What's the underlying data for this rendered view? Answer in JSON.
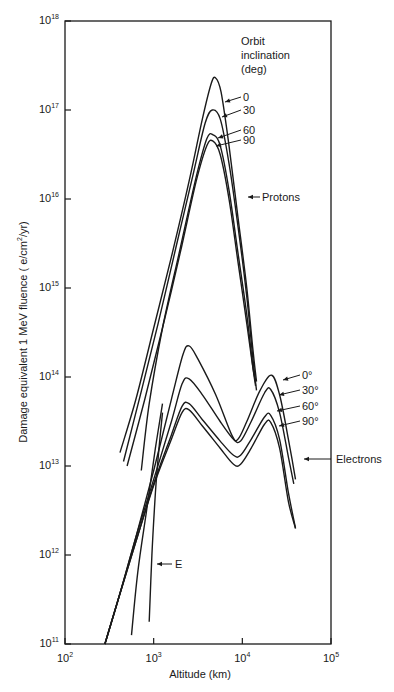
{
  "chart_data": {
    "type": "line",
    "title": "",
    "xlabel": "Altitude (km)",
    "ylabel": "Damage equivalent 1 MeV fluence ( e/cm²/yr)",
    "ylabel_parts": {
      "pre": "Damage equivalent 1 MeV fluence ( e/cm",
      "sup": "2",
      "post": "/yr)"
    },
    "xscale": "log",
    "yscale": "log",
    "xlim": [
      100,
      100000
    ],
    "ylim": [
      100000000000.0,
      1e+18
    ],
    "grid": false,
    "x_ticks": [
      {
        "base": "10",
        "exp": "2"
      },
      {
        "base": "10",
        "exp": "3"
      },
      {
        "base": "10",
        "exp": "4"
      },
      {
        "base": "10",
        "exp": "5"
      }
    ],
    "y_ticks": [
      {
        "base": "10",
        "exp": "18"
      },
      {
        "base": "10",
        "exp": "17"
      },
      {
        "base": "10",
        "exp": "16"
      },
      {
        "base": "10",
        "exp": "15"
      },
      {
        "base": "10",
        "exp": "14"
      },
      {
        "base": "10",
        "exp": "13"
      },
      {
        "base": "10",
        "exp": "12"
      },
      {
        "base": "10",
        "exp": "11"
      }
    ],
    "legend": {
      "title_lines": [
        "Orbit",
        "inclination",
        "(deg)"
      ],
      "position": "top-right inside"
    },
    "series": [
      {
        "name": "Protons 0°",
        "group": "Protons",
        "inclination": 0,
        "points_log": [
          [
            2.62,
            13.15
          ],
          [
            2.8,
            13.75
          ],
          [
            3.0,
            14.55
          ],
          [
            3.2,
            15.35
          ],
          [
            3.4,
            16.2
          ],
          [
            3.55,
            16.9
          ],
          [
            3.65,
            17.3
          ],
          [
            3.7,
            17.36
          ],
          [
            3.76,
            17.2
          ],
          [
            3.85,
            16.6
          ],
          [
            3.95,
            15.8
          ],
          [
            4.05,
            15.0
          ],
          [
            4.12,
            14.3
          ],
          [
            4.16,
            13.95
          ]
        ]
      },
      {
        "name": "Protons 30°",
        "group": "Protons",
        "inclination": 30,
        "points_log": [
          [
            2.66,
            13.05
          ],
          [
            2.85,
            13.8
          ],
          [
            3.05,
            14.6
          ],
          [
            3.25,
            15.45
          ],
          [
            3.45,
            16.3
          ],
          [
            3.58,
            16.85
          ],
          [
            3.66,
            17.0
          ],
          [
            3.75,
            16.9
          ],
          [
            3.85,
            16.4
          ],
          [
            3.95,
            15.7
          ],
          [
            4.05,
            14.9
          ],
          [
            4.12,
            14.2
          ],
          [
            4.16,
            13.85
          ]
        ]
      },
      {
        "name": "Protons 60°",
        "group": "Protons",
        "inclination": 60,
        "points_log": [
          [
            2.86,
            12.95
          ],
          [
            2.95,
            13.7
          ],
          [
            3.1,
            14.55
          ],
          [
            3.3,
            15.45
          ],
          [
            3.48,
            16.25
          ],
          [
            3.6,
            16.68
          ],
          [
            3.67,
            16.72
          ],
          [
            3.75,
            16.6
          ],
          [
            3.85,
            16.1
          ],
          [
            3.95,
            15.4
          ],
          [
            4.05,
            14.7
          ],
          [
            4.12,
            14.1
          ],
          [
            4.15,
            13.9
          ]
        ]
      },
      {
        "name": "Protons 90°",
        "group": "Protons",
        "inclination": 90,
        "points_log": [
          [
            2.7,
            13.0
          ],
          [
            2.9,
            13.75
          ],
          [
            3.1,
            14.55
          ],
          [
            3.3,
            15.4
          ],
          [
            3.48,
            16.2
          ],
          [
            3.6,
            16.6
          ],
          [
            3.67,
            16.65
          ],
          [
            3.75,
            16.5
          ],
          [
            3.85,
            16.0
          ],
          [
            3.95,
            15.3
          ],
          [
            4.05,
            14.6
          ],
          [
            4.12,
            14.1
          ],
          [
            4.15,
            13.95
          ]
        ]
      },
      {
        "name": "Electrons 0°",
        "group": "Electrons",
        "inclination": 0,
        "points_log": [
          [
            2.45,
            11.0
          ],
          [
            2.6,
            11.5
          ],
          [
            2.8,
            12.2
          ],
          [
            3.0,
            12.95
          ],
          [
            3.2,
            13.75
          ],
          [
            3.33,
            14.25
          ],
          [
            3.4,
            14.35
          ],
          [
            3.5,
            14.2
          ],
          [
            3.7,
            13.8
          ],
          [
            3.88,
            13.35
          ],
          [
            3.95,
            13.3
          ],
          [
            4.05,
            13.5
          ],
          [
            4.2,
            13.85
          ],
          [
            4.33,
            14.02
          ],
          [
            4.42,
            13.8
          ],
          [
            4.52,
            13.3
          ],
          [
            4.6,
            12.85
          ]
        ]
      },
      {
        "name": "Electrons 30°",
        "group": "Electrons",
        "inclination": 30,
        "points_log": [
          [
            2.45,
            11.0
          ],
          [
            2.6,
            11.5
          ],
          [
            2.8,
            12.2
          ],
          [
            3.0,
            12.85
          ],
          [
            3.2,
            13.5
          ],
          [
            3.32,
            13.92
          ],
          [
            3.4,
            13.98
          ],
          [
            3.55,
            13.8
          ],
          [
            3.75,
            13.5
          ],
          [
            3.9,
            13.3
          ],
          [
            3.98,
            13.28
          ],
          [
            4.1,
            13.5
          ],
          [
            4.25,
            13.82
          ],
          [
            4.32,
            13.86
          ],
          [
            4.42,
            13.6
          ],
          [
            4.52,
            13.1
          ],
          [
            4.58,
            12.8
          ]
        ]
      },
      {
        "name": "Electrons 60°",
        "group": "Electrons",
        "inclination": 60,
        "points_log": [
          [
            2.45,
            11.0
          ],
          [
            2.6,
            11.5
          ],
          [
            2.8,
            12.15
          ],
          [
            3.0,
            12.8
          ],
          [
            3.2,
            13.35
          ],
          [
            3.32,
            13.67
          ],
          [
            3.4,
            13.7
          ],
          [
            3.55,
            13.52
          ],
          [
            3.75,
            13.28
          ],
          [
            3.9,
            13.12
          ],
          [
            3.98,
            13.12
          ],
          [
            4.1,
            13.3
          ],
          [
            4.25,
            13.55
          ],
          [
            4.32,
            13.57
          ],
          [
            4.42,
            13.3
          ],
          [
            4.52,
            12.7
          ],
          [
            4.6,
            12.3
          ]
        ]
      },
      {
        "name": "Electrons 90°",
        "group": "Electrons",
        "inclination": 90,
        "points_log": [
          [
            2.45,
            11.0
          ],
          [
            2.6,
            11.5
          ],
          [
            2.8,
            12.15
          ],
          [
            3.0,
            12.78
          ],
          [
            3.2,
            13.3
          ],
          [
            3.32,
            13.6
          ],
          [
            3.4,
            13.63
          ],
          [
            3.55,
            13.45
          ],
          [
            3.75,
            13.2
          ],
          [
            3.9,
            13.02
          ],
          [
            3.98,
            13.02
          ],
          [
            4.1,
            13.2
          ],
          [
            4.25,
            13.47
          ],
          [
            4.32,
            13.49
          ],
          [
            4.42,
            13.2
          ],
          [
            4.52,
            12.6
          ],
          [
            4.6,
            12.3
          ]
        ]
      },
      {
        "name": "E curve",
        "group": "E",
        "points_log": [
          [
            2.95,
            11.25
          ],
          [
            2.98,
            12.0
          ],
          [
            3.02,
            12.7
          ],
          [
            3.06,
            13.2
          ],
          [
            3.1,
            13.6
          ]
        ]
      },
      {
        "name": "Low-altitude branch",
        "group": "Electrons",
        "points_log": [
          [
            2.75,
            11.1
          ],
          [
            2.82,
            11.8
          ],
          [
            2.92,
            12.5
          ],
          [
            3.02,
            13.2
          ],
          [
            3.1,
            13.7
          ]
        ]
      }
    ],
    "annotations": {
      "protons_inclinations": [
        "0",
        "30",
        "60",
        "90"
      ],
      "electrons_inclinations": [
        "0°",
        "30°",
        "60°",
        "90°"
      ],
      "protons_label": "Protons",
      "electrons_label": "Electrons",
      "e_label": "E"
    },
    "line_color": "#1a1a1a"
  }
}
